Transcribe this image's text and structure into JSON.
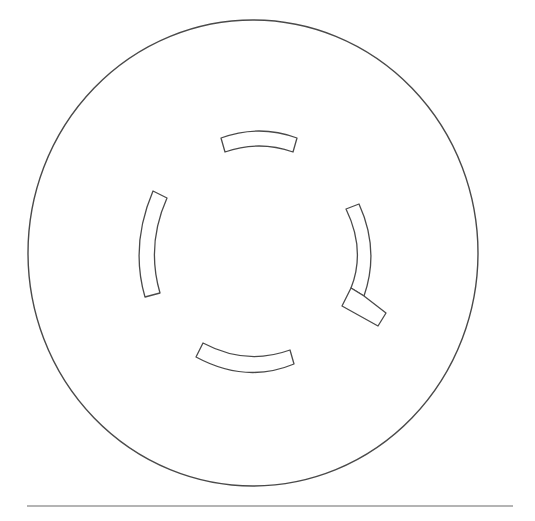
{
  "diagram": {
    "title": "",
    "colors": {
      "stroke": "#4a4a4a",
      "rule": "#6a6a6a",
      "background": "#ffffff"
    },
    "outline": {
      "shape": "ellipse",
      "cx": 253,
      "cy": 253,
      "rx": 225,
      "ry": 233
    },
    "slots": [
      {
        "id": "top",
        "path": "M221,138 Q259,124 297,138 L293,152 Q259,140 225,152 Z"
      },
      {
        "id": "left",
        "path": "M153,191 Q130,245 145,297 L160,293 Q146,245 167,198 Z"
      },
      {
        "id": "right",
        "path": "M346,209 L359,204 Q380,250 364,296 L351,288 Q366,250 346,209 Z"
      },
      {
        "id": "right-foot",
        "path": "M351,288 L342,306 L378,326 L386,313 L364,296 Z"
      },
      {
        "id": "bottom",
        "path": "M203,343 Q246,366 290,350 L294,364 Q246,384 196,357 Z"
      }
    ],
    "rule": {
      "x1": 27,
      "x2": 513,
      "y": 506
    },
    "caption": ""
  }
}
